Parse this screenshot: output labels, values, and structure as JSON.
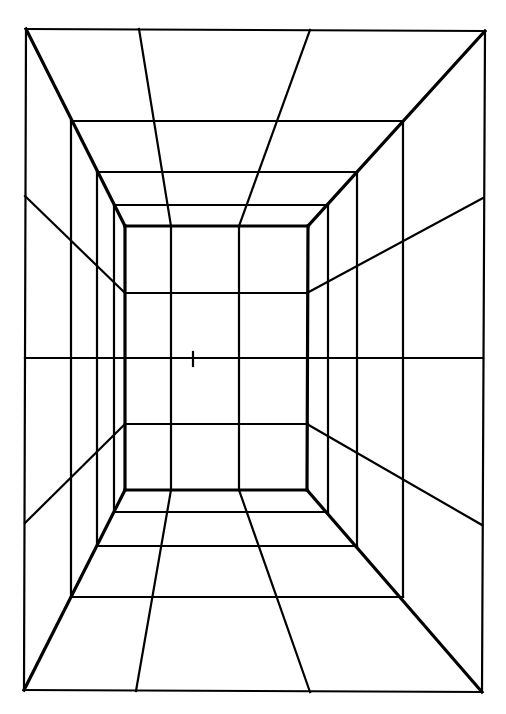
{
  "figure": {
    "title": "One-point perspective room grid"
  },
  "colors": {
    "background": "#ffffff",
    "line": "#000000"
  },
  "vanishing_point": {
    "x": 193,
    "y": 359
  },
  "outer_frame": {
    "tl": [
      26,
      29
    ],
    "tr": [
      485,
      31
    ],
    "br": [
      482,
      692
    ],
    "bl": [
      24,
      690
    ]
  },
  "back_wall": {
    "tl": [
      125,
      226
    ],
    "tr": [
      308,
      226
    ],
    "br": [
      307,
      490
    ],
    "bl": [
      125,
      490
    ]
  },
  "depth_frames": [
    {
      "left_x": 71,
      "right_x": 403,
      "top_y": 121,
      "bottom_y": 597
    },
    {
      "left_x": 97,
      "right_x": 357,
      "top_y": 172,
      "bottom_y": 546
    },
    {
      "left_x": 114,
      "right_x": 328,
      "top_y": 205,
      "bottom_y": 512
    }
  ],
  "back_wall_verticals_x": [
    171,
    239
  ],
  "back_wall_horizontals_y": [
    293,
    358,
    424
  ],
  "ceiling_rays": [
    {
      "from": [
        139,
        29
      ],
      "to": [
        171,
        226
      ]
    },
    {
      "from": [
        310,
        30
      ],
      "to": [
        239,
        226
      ]
    }
  ],
  "floor_rays": [
    {
      "from": [
        136,
        691
      ],
      "to": [
        171,
        490
      ]
    },
    {
      "from": [
        310,
        692
      ],
      "to": [
        239,
        490
      ]
    }
  ],
  "left_wall_rays": [
    {
      "from": [
        25,
        196
      ],
      "to": [
        125,
        293
      ]
    },
    {
      "from": [
        25,
        358
      ],
      "to": [
        125,
        358
      ]
    },
    {
      "from": [
        25,
        523
      ],
      "to": [
        125,
        424
      ]
    }
  ],
  "right_wall_rays": [
    {
      "from": [
        483,
        198
      ],
      "to": [
        307,
        293
      ]
    },
    {
      "from": [
        483,
        358
      ],
      "to": [
        307,
        358
      ]
    },
    {
      "from": [
        482,
        525
      ],
      "to": [
        307,
        424
      ]
    }
  ],
  "tick_mark": {
    "x": 193,
    "y1": 352,
    "y2": 366
  }
}
